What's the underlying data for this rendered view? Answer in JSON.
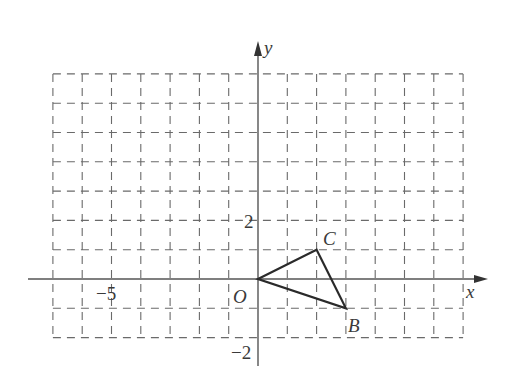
{
  "diagram": {
    "type": "coordinate-grid",
    "grid": {
      "x_min": -7,
      "x_max": 7,
      "y_min": -2,
      "y_max": 7,
      "unit_px": 29.3,
      "origin_px": [
        258,
        279
      ],
      "line_style": "dashed",
      "color": "#6a6a6a"
    },
    "axes": {
      "x_label": "x",
      "y_label": "y",
      "origin_label": "O",
      "color": "#555555"
    },
    "tick_labels": [
      {
        "axis": "x",
        "value": -5,
        "text": "−5"
      },
      {
        "axis": "y",
        "value": 2,
        "text": "2"
      },
      {
        "axis": "y",
        "value": -2,
        "text": "−2"
      }
    ],
    "triangle": {
      "vertices": [
        {
          "name": "O",
          "x": 0,
          "y": 0
        },
        {
          "name": "C",
          "x": 2,
          "y": 1
        },
        {
          "name": "B",
          "x": 3,
          "y": -1
        }
      ],
      "stroke": "#2a2a2a"
    },
    "point_labels": {
      "C": "C",
      "B": "B"
    }
  }
}
